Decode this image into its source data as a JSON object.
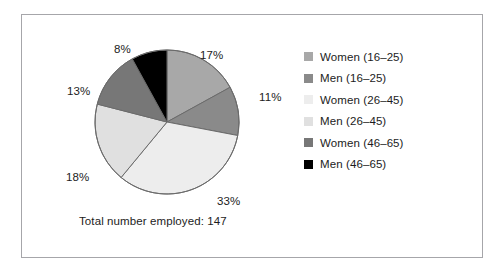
{
  "figure": {
    "border_color": "#a6a6aa",
    "background": "#ffffff",
    "caption": "Total number employed: 147"
  },
  "legend": {
    "position": "right",
    "items": [
      {
        "label": "Women (16–25)",
        "color": "#a8a8a8"
      },
      {
        "label": "Men (16–25)",
        "color": "#8a8a8a"
      },
      {
        "label": "Women (26–45)",
        "color": "#ededed"
      },
      {
        "label": "Men (26–45)",
        "color": "#e0e0e0"
      },
      {
        "label": "Women (46–65)",
        "color": "#777777"
      },
      {
        "label": "Men (46–65)",
        "color": "#000000"
      }
    ]
  },
  "chart_data": {
    "type": "pie",
    "title": "",
    "xlabel": "",
    "ylabel": "",
    "total": 147,
    "total_label": "Total number employed: 147",
    "start_angle_deg": 0,
    "direction": "clockwise",
    "categories": [
      "Women (16–25)",
      "Men (16–25)",
      "Women (26–45)",
      "Men (26–45)",
      "Women (46–65)",
      "Men (46–65)"
    ],
    "values": [
      17,
      11,
      33,
      18,
      13,
      8
    ],
    "value_labels": [
      "17%",
      "11%",
      "33%",
      "18%",
      "13%",
      "8%"
    ],
    "colors": [
      "#a8a8a8",
      "#8a8a8a",
      "#ededed",
      "#e0e0e0",
      "#777777",
      "#000000"
    ],
    "slice_outline_color": "#6b6b6b",
    "legend_position": "right",
    "grid": false
  },
  "labels": {
    "p17": "17%",
    "p11": "11%",
    "p33": "33%",
    "p18": "18%",
    "p13": "13%",
    "p8": "8%"
  }
}
